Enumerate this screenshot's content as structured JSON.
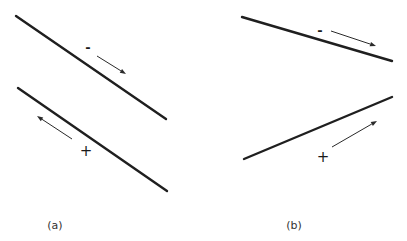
{
  "figure": {
    "panels": [
      {
        "id": "a",
        "label": "(a)",
        "label_pos": [
          55,
          229
        ],
        "lines": [
          {
            "name": "upper-line",
            "x1": 16,
            "y1": 16,
            "x2": 166,
            "y2": 119
          },
          {
            "name": "lower-line",
            "x1": 18,
            "y1": 88,
            "x2": 167,
            "y2": 191
          }
        ],
        "arrows": [
          {
            "name": "upper-arrow",
            "x1": 97,
            "y1": 56,
            "x2": 126,
            "y2": 74
          },
          {
            "name": "lower-arrow",
            "x1": 72,
            "y1": 139,
            "x2": 37,
            "y2": 116
          }
        ],
        "signs": [
          {
            "name": "minus-sign",
            "text": "-",
            "x": 88,
            "y": 52
          },
          {
            "name": "plus-sign",
            "text": "+",
            "x": 86,
            "y": 156
          }
        ]
      },
      {
        "id": "b",
        "label": "(b)",
        "label_pos": [
          294,
          229
        ],
        "lines": [
          {
            "name": "upper-line",
            "x1": 242,
            "y1": 17,
            "x2": 392,
            "y2": 61
          },
          {
            "name": "lower-line",
            "x1": 244,
            "y1": 159,
            "x2": 392,
            "y2": 97
          }
        ],
        "arrows": [
          {
            "name": "upper-arrow",
            "x1": 331,
            "y1": 31,
            "x2": 376,
            "y2": 46
          },
          {
            "name": "lower-arrow",
            "x1": 332,
            "y1": 147,
            "x2": 377,
            "y2": 121
          }
        ],
        "signs": [
          {
            "name": "minus-sign",
            "text": "-",
            "x": 320,
            "y": 35
          },
          {
            "name": "plus-sign",
            "text": "+",
            "x": 323,
            "y": 162
          }
        ]
      }
    ],
    "colors": {
      "line": "#1f1f1f",
      "arrow": "#2a2a2a",
      "text": "#1a1a1a",
      "background": "#ffffff"
    }
  }
}
